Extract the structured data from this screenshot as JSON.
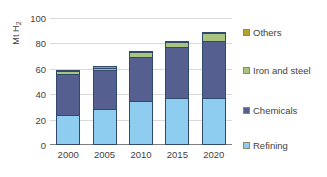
{
  "chart_data": {
    "type": "bar",
    "stacked": true,
    "title": "",
    "xlabel": "",
    "ylabel": "Mt H2",
    "ylabel_display": "Mt H",
    "ylabel_sub": "2",
    "categories": [
      "2000",
      "2005",
      "2010",
      "2015",
      "2020"
    ],
    "ylim": [
      0,
      100
    ],
    "yticks": [
      0,
      20,
      40,
      60,
      80,
      100
    ],
    "ytick_labels": [
      "0",
      "20",
      "40",
      "60",
      "80",
      "100"
    ],
    "grid": true,
    "legend_position": "right",
    "series": [
      {
        "name": "Refining",
        "color": "#8ecdf0",
        "values": [
          24,
          28,
          35,
          37,
          37
        ]
      },
      {
        "name": "Chemicals",
        "color": "#555f90",
        "values": [
          32,
          31,
          34,
          40,
          45
        ]
      },
      {
        "name": "Iron and steel",
        "color": "#a9c47f",
        "values": [
          2,
          2,
          4,
          4,
          6
        ]
      },
      {
        "name": "Others",
        "color": "#b6a22b",
        "values": [
          1,
          1,
          1,
          1,
          1
        ]
      }
    ],
    "totals": [
      59,
      62,
      74,
      82,
      89
    ]
  },
  "legend": {
    "items": [
      {
        "label": "Others",
        "color": "#b6a22b"
      },
      {
        "label": "Iron and steel",
        "color": "#a9c47f"
      },
      {
        "label": "Chemicals",
        "color": "#555f90"
      },
      {
        "label": "Refining",
        "color": "#8ecdf0"
      }
    ]
  },
  "colors": {
    "grid": "#d9d9d9",
    "axis": "#7f7f7f",
    "text": "#3f3f3f",
    "bar_outline": "#31496b",
    "background": "#ffffff"
  }
}
